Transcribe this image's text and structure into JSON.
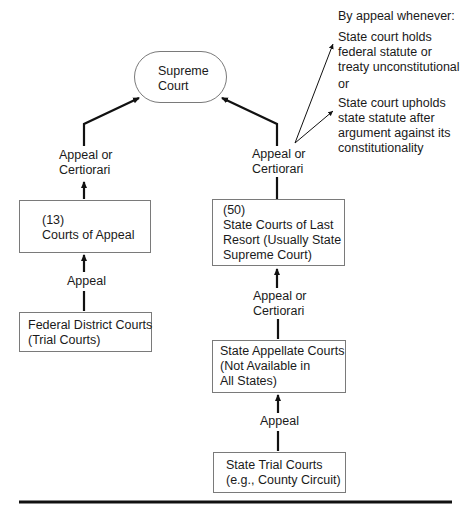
{
  "nodes": {
    "supreme": {
      "lines": [
        "Supreme",
        "Court"
      ]
    },
    "courts_of_appeal": {
      "lines": [
        "(13)",
        "Courts of Appeal"
      ]
    },
    "federal_district": {
      "lines": [
        "Federal District Courts",
        "(Trial Courts)"
      ]
    },
    "state_last_resort": {
      "lines": [
        "(50)",
        "State Courts of Last",
        "Resort (Usually State",
        "Supreme Court)"
      ]
    },
    "state_appellate": {
      "lines": [
        "State Appellate Courts",
        "(Not Available in",
        "All States)"
      ]
    },
    "state_trial": {
      "lines": [
        "State Trial Courts",
        "(e.g., County Circuit)"
      ]
    }
  },
  "edges": {
    "left_top": {
      "lines": [
        "Appeal or",
        "Certiorari"
      ]
    },
    "left_bottom": {
      "lines": [
        "Appeal"
      ]
    },
    "right_top": {
      "lines": [
        "Appeal or",
        "Certiorari"
      ]
    },
    "right_middle": {
      "lines": [
        "Appeal or",
        "Certiorari"
      ]
    },
    "right_bottom": {
      "lines": [
        "Appeal"
      ]
    }
  },
  "note": {
    "heading": "By appeal whenever:",
    "condition_1": [
      "State court holds",
      "federal statute or",
      "treaty unconstitutional"
    ],
    "connector": "or",
    "condition_2": [
      "State court upholds",
      "state statute after",
      "argument against its",
      "constitutionality"
    ]
  }
}
